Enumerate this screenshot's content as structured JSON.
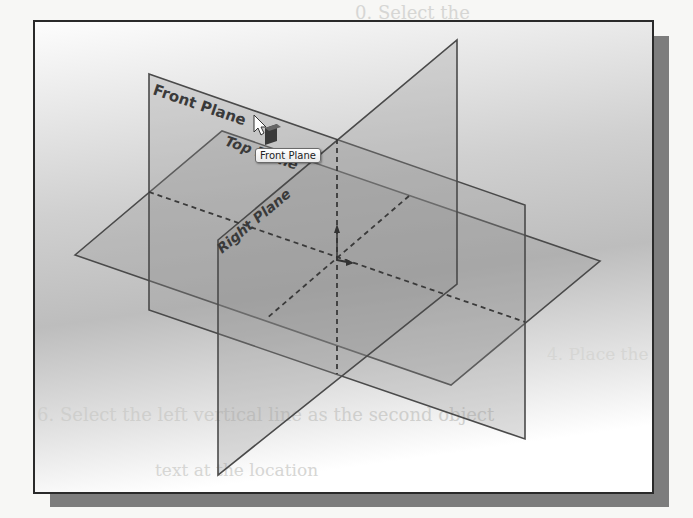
{
  "background_ghost_text": [
    "0. Select the",
    "centerline",
    "settin",
    "4. Place the dimension",
    "6. Select the left vertical line as the second object",
    "text at the location"
  ],
  "viewport": {
    "planes": [
      {
        "id": "front",
        "label": "Front Plane",
        "highlighted": true
      },
      {
        "id": "top",
        "label": "Top Plane"
      },
      {
        "id": "right",
        "label": "Right Plane"
      }
    ],
    "tooltip": {
      "text": "Front Plane"
    },
    "cursor": {
      "type": "select-arrow-with-plane-icon"
    }
  },
  "colors": {
    "frame_border": "#2a2a2a",
    "shadow": "#7d7d7d",
    "plane_edge": "#4a4a4a",
    "plane_fill": "#9c9c9c"
  }
}
